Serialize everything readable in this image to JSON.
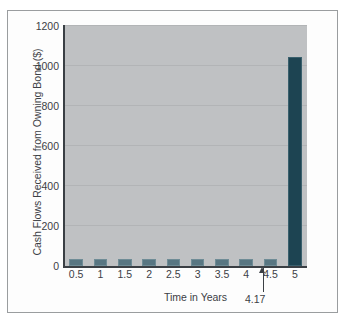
{
  "chart_data": {
    "type": "bar",
    "title": "",
    "xlabel": "Time in Years",
    "ylabel": "Cash Flows Received from Owning Bond ($)",
    "categories": [
      "0.5",
      "1",
      "1.5",
      "2",
      "2.5",
      "3",
      "3.5",
      "4",
      "4.5",
      "5"
    ],
    "values": [
      35,
      35,
      35,
      35,
      35,
      35,
      35,
      35,
      35,
      1045
    ],
    "ylim": [
      0,
      1200
    ],
    "yticks": [
      "0",
      "200",
      "400",
      "600",
      "800",
      "1000",
      "1200"
    ],
    "ytick_values": [
      0,
      200,
      400,
      600,
      800,
      1000,
      1200
    ],
    "grid": true,
    "legend": false,
    "series": [
      {
        "name": "Cash Flows Received from Owning Bond ($)",
        "values": [
          35,
          35,
          35,
          35,
          35,
          35,
          35,
          35,
          35,
          1045
        ]
      }
    ],
    "annotations": [
      {
        "label": "4.17",
        "x": 4.17,
        "marker": "up-arrow",
        "description": "Arrow pointing up to the 4.17 year position on the time axis"
      }
    ],
    "colors": {
      "coupon_bar": "#587682",
      "final_bar": "#1d4452",
      "plot_background": "#bfc1c3",
      "figure_background": "#fdfdfd",
      "axis": "#3a3f44",
      "gridline": "#b2b4b6",
      "text": "#3c4045",
      "frame_border": "#9a9d9f"
    }
  }
}
